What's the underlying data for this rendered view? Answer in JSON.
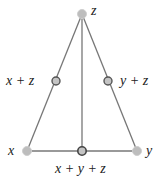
{
  "diagram": {
    "colors": {
      "edge": "#777777",
      "node_fill": "#bdbdbd",
      "node_stroke_plain": "#c8c8c8",
      "node_stroke_outlined": "#555555",
      "label": "#222222"
    },
    "nodes": [
      {
        "id": "z",
        "label": "z",
        "x": 82,
        "y": 14,
        "style": "plain"
      },
      {
        "id": "x_plus_z",
        "label": "x + z",
        "x": 56,
        "y": 81,
        "style": "outlined"
      },
      {
        "id": "y_plus_z",
        "label": "y + z",
        "x": 108,
        "y": 81,
        "style": "outlined"
      },
      {
        "id": "x",
        "label": "x",
        "x": 27,
        "y": 151,
        "style": "plain"
      },
      {
        "id": "x_plus_y_plus_z",
        "label": "x + y + z",
        "x": 82,
        "y": 151,
        "style": "outlined"
      },
      {
        "id": "y",
        "label": "y",
        "x": 137,
        "y": 151,
        "style": "plain"
      }
    ],
    "edges": [
      {
        "from": "z",
        "to": "x"
      },
      {
        "from": "z",
        "to": "y"
      },
      {
        "from": "z",
        "to": "x_plus_y_plus_z"
      },
      {
        "from": "x",
        "to": "y"
      }
    ],
    "labels": {
      "z": "z",
      "x_plus_z": "x + z",
      "y_plus_z": "y + z",
      "x": "x",
      "y": "y",
      "x_plus_y_plus_z": "x + y + z"
    }
  }
}
